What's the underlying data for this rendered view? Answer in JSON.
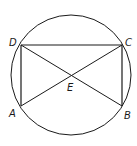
{
  "diagram": {
    "type": "geometry",
    "circle": {
      "cx": 71,
      "cy": 75,
      "r": 60
    },
    "points": {
      "A": {
        "label": "A",
        "x": 21,
        "y": 106
      },
      "B": {
        "label": "B",
        "x": 122,
        "y": 106
      },
      "C": {
        "label": "C",
        "x": 122,
        "y": 45
      },
      "D": {
        "label": "D",
        "x": 21,
        "y": 45
      },
      "E": {
        "label": "E",
        "x": 71,
        "y": 76
      }
    },
    "segments": [
      "DC",
      "CB",
      "BA",
      "AD",
      "AC",
      "DB"
    ],
    "colors": {
      "stroke": "#1a1a1a",
      "background": "#ffffff"
    }
  }
}
